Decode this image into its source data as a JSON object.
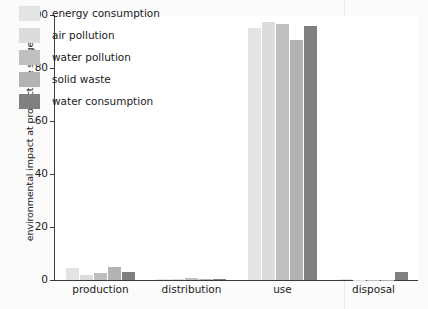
{
  "chart_data": {
    "type": "bar",
    "title": "",
    "xlabel": "",
    "ylabel": "environmental impact at product life stage/%",
    "ylim": [
      0,
      100
    ],
    "ytick_labels": [
      "0",
      "20",
      "40",
      "60",
      "80",
      "100"
    ],
    "ytick_values": [
      0,
      20,
      40,
      60,
      80,
      100
    ],
    "grid": false,
    "legend_position": "upper-left-inside",
    "categories": [
      "production",
      "distribution",
      "use",
      "disposal"
    ],
    "series": [
      {
        "name": "energy consumption",
        "color": "#e4e4e4",
        "values": [
          4.5,
          0.3,
          95.0,
          0.2
        ]
      },
      {
        "name": "air pollution",
        "color": "#dcdcdc",
        "values": [
          2.0,
          0.3,
          97.5,
          0.0
        ]
      },
      {
        "name": "water pollution",
        "color": "#bfbfbf",
        "values": [
          2.5,
          0.6,
          96.5,
          0.0
        ]
      },
      {
        "name": "solid waste",
        "color": "#b3b3b3",
        "values": [
          5.0,
          0.5,
          90.5,
          0.0
        ]
      },
      {
        "name": "water consumption",
        "color": "#808080",
        "values": [
          3.0,
          0.5,
          96.0,
          3.0
        ]
      }
    ]
  }
}
